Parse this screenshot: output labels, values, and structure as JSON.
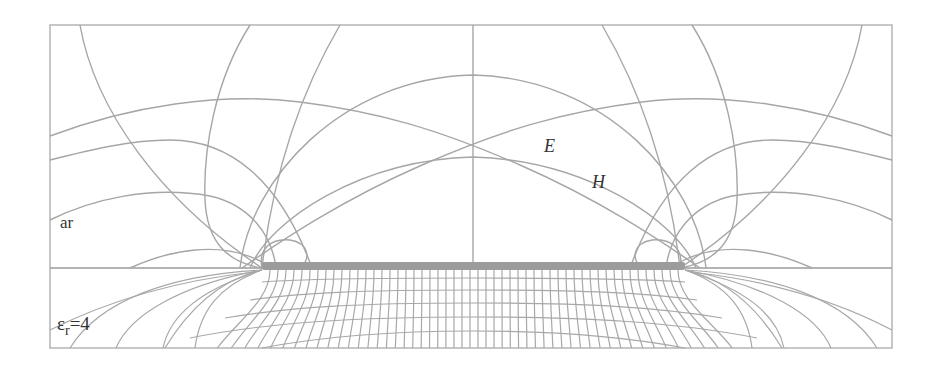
{
  "figure": {
    "labels": {
      "upper_region": "ar",
      "lower_region_symbol": "ε",
      "lower_region_subscript": "r",
      "lower_region_value": "=4",
      "electric_field": "E",
      "magnetic_field": "H"
    },
    "regions": {
      "upper": "air",
      "lower": "dielectric substrate, relative permittivity 4"
    },
    "colors": {
      "lines": "#a6a6a6",
      "strip": "#9c9c9c",
      "text": "#333333",
      "background": "#ffffff"
    }
  }
}
